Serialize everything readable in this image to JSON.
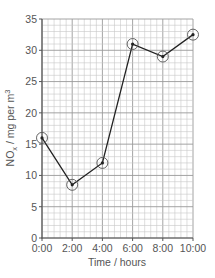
{
  "chart_data": {
    "type": "line",
    "title": "",
    "xlabel": "Time / hours",
    "ylabel": "NOx / mg per m3",
    "ylabel_parts": {
      "main": "NO",
      "sub": "x",
      "rest": " / mg per m",
      "sup": "3"
    },
    "x": [
      "0:00",
      "2:00",
      "4:00",
      "6:00",
      "8:00",
      "10:00"
    ],
    "series": [
      {
        "name": "NOx",
        "values": [
          16,
          8.5,
          12,
          31,
          29,
          32.5
        ],
        "marker": "circled-dot",
        "color": "#222222"
      }
    ],
    "yticks": [
      0,
      5,
      10,
      15,
      20,
      25,
      30,
      35
    ],
    "ylim": [
      0,
      35
    ],
    "grid": {
      "major_x_step_hours": 2,
      "minor_per_major_x": 5,
      "major_y_step": 5,
      "minor_per_major_y": 5
    },
    "legend": null
  },
  "colors": {
    "axis": "#555555",
    "minor_grid": "#c8c8c8",
    "major_grid": "#9a9a9a",
    "line": "#222222"
  }
}
